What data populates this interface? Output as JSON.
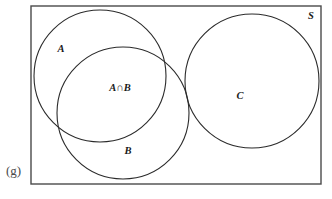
{
  "figure": {
    "caption": "(g)",
    "universal_set_label": "S",
    "stroke_color": "#4a4a4a",
    "label_color": "#1a1a1a",
    "background": "#ffffff"
  },
  "diagram": {
    "type": "venn",
    "universe": {
      "name": "S",
      "label": "S",
      "shape": "rectangle",
      "x": 31,
      "y": 6,
      "width": 290,
      "height": 178,
      "label_x": 311,
      "label_y": 17
    },
    "sets": [
      {
        "name": "A",
        "label": "A",
        "cx": 100,
        "cy": 76,
        "r": 66,
        "label_x": 61,
        "label_y": 50
      },
      {
        "name": "B",
        "label": "B",
        "cx": 123,
        "cy": 113,
        "r": 66,
        "label_x": 128,
        "label_y": 152
      },
      {
        "name": "C",
        "label": "C",
        "cx": 252,
        "cy": 81,
        "r": 67,
        "label_x": 240,
        "label_y": 97
      }
    ],
    "regions": [
      {
        "name": "A-intersect-B",
        "label": "A∩B",
        "label_x": 120,
        "label_y": 89
      }
    ],
    "relations": {
      "A_and_B": "overlapping",
      "C": "disjoint from A and B"
    }
  }
}
